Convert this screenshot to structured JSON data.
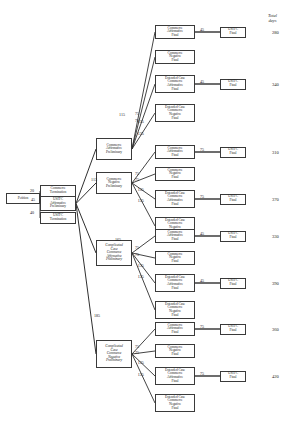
{
  "page": {
    "title_partial": "",
    "background": "#ffffff",
    "line_color": "#2f2f2f",
    "box_border": "#3a3a3a"
  },
  "totals_header": "Total\ndays",
  "root": {
    "label": "Petition"
  },
  "stage1": [
    {
      "label": "Commerce\nTermination",
      "edge": "20"
    },
    {
      "label": "USITC\nAffirmative\nPreliminary",
      "edge": "45"
    },
    {
      "label": "USITC\nTermination",
      "edge": "40"
    }
  ],
  "stage2": [
    {
      "label": "Commerce\nAffirmative\nPreliminary",
      "edge": "115"
    },
    {
      "label": "Commerce\nNegative\nPreliminary",
      "edge": "115"
    },
    {
      "label": "Complicated\nCase\nCommerce\nAffirmative\nPreliminary",
      "edge": "165"
    },
    {
      "label": "Complicated\nCase\nCommerce\nNegative\nPreliminary",
      "edge": "185"
    }
  ],
  "stage3_labels": {
    "commerce_affirmative_final": "Commerce\nAffirmative\nFinal",
    "commerce_negative_final": "Commerce\nNegative\nFinal",
    "extended_affirmative_final": "Extended Case\nCommerce\nAffirmative\nFinal",
    "extended_negative_final": "Extended Case\nCommerce\nNegative\nFinal"
  },
  "stage3_edges": {
    "short": "75",
    "extended": "135"
  },
  "final_node_label": "USITC\nFinal",
  "branches": [
    {
      "id": "commerce-affirmative-preliminary",
      "outcomes": [
        {
          "type": "commerce_affirmative_final",
          "edge": "75",
          "final_edge": "45",
          "total": "280"
        },
        {
          "type": "commerce_negative_final",
          "edge": "75",
          "final_edge": "",
          "total": ""
        },
        {
          "type": "extended_affirmative_final",
          "edge": "135",
          "final_edge": "45",
          "total": "340"
        },
        {
          "type": "extended_negative_final",
          "edge": "135",
          "final_edge": "",
          "total": ""
        }
      ]
    },
    {
      "id": "commerce-negative-preliminary",
      "outcomes": [
        {
          "type": "commerce_affirmative_final",
          "edge": "75",
          "final_edge": "75",
          "total": "310"
        },
        {
          "type": "commerce_negative_final",
          "edge": "75",
          "final_edge": "",
          "total": ""
        },
        {
          "type": "extended_affirmative_final",
          "edge": "135",
          "final_edge": "75",
          "total": "370"
        },
        {
          "type": "extended_negative_final",
          "edge": "135",
          "final_edge": "",
          "total": ""
        }
      ]
    },
    {
      "id": "complicated-commerce-affirmative-preliminary",
      "outcomes": [
        {
          "type": "commerce_affirmative_final",
          "edge": "75",
          "final_edge": "45",
          "total": "330"
        },
        {
          "type": "commerce_negative_final",
          "edge": "75",
          "final_edge": "",
          "total": ""
        },
        {
          "type": "extended_affirmative_final",
          "edge": "135",
          "final_edge": "45",
          "total": "390"
        },
        {
          "type": "extended_negative_final",
          "edge": "135",
          "final_edge": "",
          "total": ""
        }
      ]
    },
    {
      "id": "complicated-commerce-negative-preliminary",
      "outcomes": [
        {
          "type": "commerce_affirmative_final",
          "edge": "75",
          "final_edge": "75",
          "total": "360"
        },
        {
          "type": "commerce_negative_final",
          "edge": "75",
          "final_edge": "",
          "total": ""
        },
        {
          "type": "extended_affirmative_final",
          "edge": "135",
          "final_edge": "75",
          "total": "420"
        },
        {
          "type": "extended_negative_final",
          "edge": "135",
          "final_edge": "",
          "total": ""
        }
      ]
    }
  ]
}
